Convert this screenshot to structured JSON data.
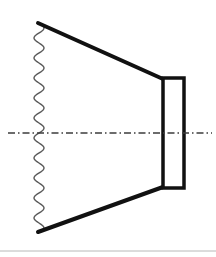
{
  "figure": {
    "title": "Axisymmetric horn cross-section diagram",
    "canvas": {
      "width": 216,
      "height": 257,
      "background_color": "#ffffff"
    },
    "colors": {
      "stroke": "#111111",
      "wave_stroke": "#5a5a5a",
      "centerline": "#3c3c3c",
      "footer_rule": "#b8b8b8",
      "fill": "#ffffff"
    },
    "elements": [
      {
        "name": "wavy-left-boundary",
        "type": "sinusoid",
        "orientation": "vertical",
        "x_center": 39,
        "amplitude": 5,
        "period": 20,
        "y_start": 23,
        "y_end": 232,
        "stroke_width": 1.4,
        "color": "#5a5a5a"
      },
      {
        "name": "upper-taper-wall",
        "type": "line",
        "x1": 38,
        "y1": 23,
        "x2": 163,
        "y2": 79,
        "stroke_width": 4,
        "color": "#111111"
      },
      {
        "name": "lower-taper-wall",
        "type": "line",
        "x1": 38,
        "y1": 232,
        "x2": 163,
        "y2": 187,
        "stroke_width": 4,
        "color": "#111111"
      },
      {
        "name": "throat-rectangle",
        "type": "rect",
        "x": 163,
        "y": 78,
        "width": 21,
        "height": 110,
        "stroke_width": 3.5,
        "color": "#111111",
        "fill": "#ffffff"
      },
      {
        "name": "axis-centerline",
        "type": "dash-dot-line",
        "x1": 8,
        "y1": 133,
        "x2": 212,
        "y2": 133,
        "stroke_width": 1.3,
        "color": "#3c3c3c",
        "dash_pattern": "7 3 1.5 3"
      },
      {
        "name": "footer-rule",
        "type": "line",
        "x1": 0,
        "y1": 251,
        "x2": 216,
        "y2": 251,
        "stroke_width": 1,
        "color": "#b8b8b8"
      }
    ]
  }
}
